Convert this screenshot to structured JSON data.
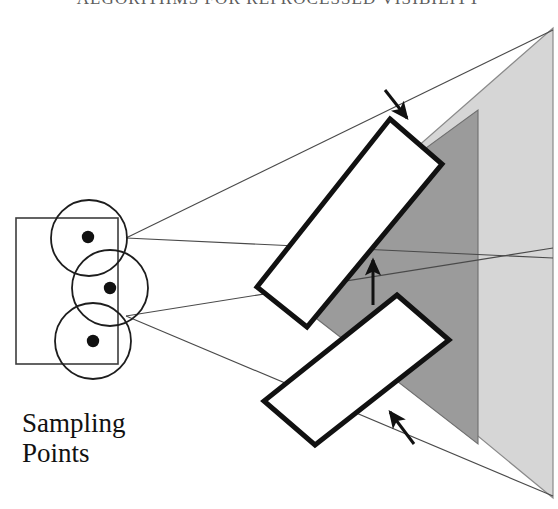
{
  "header": {
    "running_title": "ALGORITHMS FOR REPROCESSED VISIBILITY"
  },
  "caption": {
    "line1": "Sampling",
    "line2": "Points"
  },
  "colors": {
    "light_gray_triangle": "#d6d6d6",
    "dark_gray_triangle": "#9b9b9b",
    "overlap_gray": "#8f8f8f",
    "outline_black": "#111111",
    "thin_line": "#3a3a3a",
    "white_fill": "#ffffff",
    "background": "#ffffff"
  },
  "diagram": {
    "type": "geometry-illustration",
    "sampling_region": {
      "name": "light-source-rectangle",
      "x": 16,
      "y": 218,
      "width": 102,
      "height": 146,
      "stroke": "#3a3a3a"
    },
    "sampling_circles": [
      {
        "cx": 90,
        "cy": 237,
        "r": 38
      },
      {
        "cx": 90,
        "cy": 276,
        "r": 38
      },
      {
        "cx": 90,
        "cy": 315,
        "r": 38
      }
    ],
    "sampling_dots": [
      {
        "cx": 88,
        "cy": 237,
        "r": 6
      },
      {
        "cx": 110,
        "cy": 288,
        "r": 6
      },
      {
        "cx": 94,
        "cy": 340,
        "r": 6
      }
    ],
    "ray_origins": [
      {
        "x": 126,
        "y": 238
      },
      {
        "x": 126,
        "y": 316
      }
    ],
    "rays": [
      {
        "x1": 126,
        "y1": 238,
        "x2": 553,
        "y2": 32
      },
      {
        "x1": 126,
        "y1": 238,
        "x2": 553,
        "y2": 258
      },
      {
        "x1": 126,
        "y1": 316,
        "x2": 553,
        "y2": 252
      },
      {
        "x1": 126,
        "y1": 316,
        "x2": 553,
        "y2": 494
      }
    ],
    "light_triangle": {
      "name": "outer-light-gray-polygon",
      "points": "553,32 553,494 350,300",
      "fill": "#d6d6d6"
    },
    "dark_triangle": {
      "name": "inner-dark-gray-polygon",
      "points": "478,112 478,440 300,300",
      "fill": "#9b9b9b"
    },
    "white_quads": [
      {
        "name": "upper-white-polygon",
        "points": "390,120 441,164 306,326 258,287"
      },
      {
        "name": "lower-white-polygon",
        "points": "397,296 448,340 314,444 264,401"
      }
    ],
    "arrows": [
      {
        "name": "arrow-top",
        "x1": 386,
        "y1": 92,
        "x2": 409,
        "y2": 117,
        "direction": "down-right"
      },
      {
        "name": "arrow-middle",
        "x1": 374,
        "y1": 302,
        "x2": 374,
        "y2": 258,
        "direction": "up"
      },
      {
        "name": "arrow-bottom",
        "x1": 413,
        "y1": 443,
        "x2": 389,
        "y2": 412,
        "direction": "up-left"
      }
    ]
  }
}
